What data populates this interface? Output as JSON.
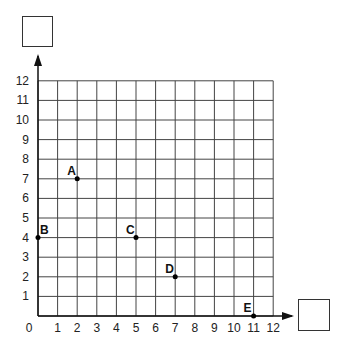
{
  "chart_data": {
    "type": "scatter",
    "title": "",
    "xlabel": "",
    "ylabel": "",
    "xlim": [
      0,
      12
    ],
    "ylim": [
      0,
      12
    ],
    "grid": true,
    "x_ticks": [
      "0",
      "1",
      "2",
      "3",
      "4",
      "5",
      "6",
      "7",
      "8",
      "9",
      "10",
      "11",
      "12"
    ],
    "y_ticks": [
      "1",
      "2",
      "3",
      "4",
      "5",
      "6",
      "7",
      "8",
      "9",
      "10",
      "11",
      "12"
    ],
    "points": [
      {
        "label": "A",
        "x": 2,
        "y": 7
      },
      {
        "label": "B",
        "x": 0,
        "y": 4
      },
      {
        "label": "C",
        "x": 5,
        "y": 4
      },
      {
        "label": "D",
        "x": 7,
        "y": 2
      },
      {
        "label": "E",
        "x": 11,
        "y": 0
      }
    ]
  },
  "answer_boxes": {
    "y_axis_label_box": "",
    "x_axis_label_box": ""
  }
}
